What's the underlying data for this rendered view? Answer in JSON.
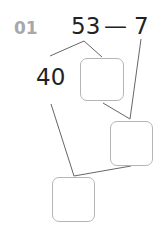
{
  "problem": {
    "number": "01",
    "minuend": "53",
    "operator": "—",
    "subtrahend": "7",
    "decomposed_part": "40"
  },
  "answer_boxes": [
    {
      "id": "box-1",
      "value": ""
    },
    {
      "id": "box-2",
      "value": ""
    },
    {
      "id": "box-3",
      "value": ""
    }
  ],
  "colors": {
    "text": "#222222",
    "label": "#a8a8a8",
    "line": "#666666",
    "box_border": "#b5b5b5"
  }
}
